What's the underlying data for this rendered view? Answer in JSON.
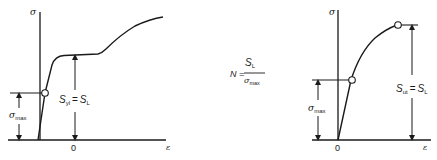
{
  "left_chart": {
    "y_axis_label": "σ",
    "x_axis_label": "ε",
    "origin_label": "0",
    "sigma_max_label": {
      "main": "σ",
      "sub": "max"
    },
    "strength_label": {
      "lhs_main": "S",
      "lhs_sub": "yl",
      "equals": "=",
      "rhs_main": "S",
      "rhs_sub": "L"
    },
    "curve_description": "ductile material with yield plateau"
  },
  "formula": {
    "lhs": "N =",
    "numerator": {
      "main": "S",
      "sub": "L"
    },
    "denominator": {
      "main": "σ",
      "sub": "max"
    }
  },
  "right_chart": {
    "y_axis_label": "σ",
    "x_axis_label": "ε",
    "origin_label": "0",
    "sigma_max_label": {
      "main": "σ",
      "sub": "max"
    },
    "strength_label": {
      "lhs_main": "S",
      "lhs_sub": "ut",
      "equals": "=",
      "rhs_main": "S",
      "rhs_sub": "L"
    },
    "curve_description": "brittle material, ultimate strength at fracture"
  },
  "colors": {
    "ink": "#1a1a1a",
    "background": "#ffffff"
  }
}
